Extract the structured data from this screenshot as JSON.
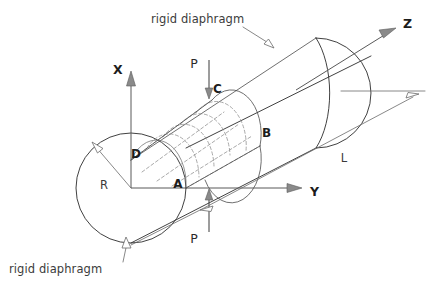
{
  "figure": {
    "background_color": "#ffffff",
    "line_color": "#2b2b2b",
    "mesh_color": "#8d8d8d",
    "axis_color": "#595959"
  },
  "axes": [
    {
      "id": "x",
      "label": "X",
      "direction": "up",
      "label_x": 118,
      "label_y": 74
    },
    {
      "id": "y",
      "label": "Y",
      "direction": "right",
      "label_x": 310,
      "label_y": 196
    },
    {
      "id": "z",
      "label": "Z",
      "direction": "upper-right",
      "label_x": 403,
      "label_y": 28
    }
  ],
  "points": [
    {
      "id": "a",
      "label": "A",
      "x": 178,
      "y": 188
    },
    {
      "id": "b",
      "label": "B",
      "x": 262,
      "y": 137
    },
    {
      "id": "c",
      "label": "C",
      "x": 213,
      "y": 93
    },
    {
      "id": "d",
      "label": "D",
      "x": 131,
      "y": 158
    }
  ],
  "loads": [
    {
      "id": "load-top",
      "label": "P",
      "label_x": 194,
      "label_y": 68,
      "direction": "down"
    },
    {
      "id": "load-bottom",
      "label": "P",
      "label_x": 194,
      "label_y": 243,
      "direction": "up"
    }
  ],
  "dimensions": [
    {
      "id": "radius",
      "label": "R",
      "label_x": 104,
      "label_y": 189,
      "description": "cylinder radius"
    },
    {
      "id": "length",
      "label": "L",
      "label_x": 344,
      "label_y": 162,
      "description": "cylinder length"
    }
  ],
  "annotations": [
    {
      "id": "diaphragm-top",
      "text": "rigid diaphragm",
      "label_x": 151,
      "label_y": 23,
      "leader_to_x": 272,
      "leader_to_y": 46
    },
    {
      "id": "diaphragm-bottom",
      "text": "rigid diaphragm",
      "label_x": 9,
      "label_y": 273,
      "leader_to_x": 124,
      "leader_to_y": 238
    }
  ],
  "mesh": {
    "description": "quarter-cylinder finite element mesh on segment A-C-B-D",
    "circumferential_divisions": 4,
    "longitudinal_divisions": 5,
    "line_style": "dashed"
  }
}
